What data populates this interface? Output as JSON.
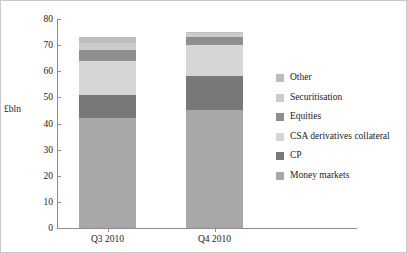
{
  "chart_data": {
    "type": "bar",
    "stacked": true,
    "title": "",
    "subtitle": "",
    "xlabel": "",
    "ylabel": "£bln",
    "ylim": [
      0,
      80
    ],
    "yticks": [
      0,
      10,
      20,
      30,
      40,
      50,
      60,
      70,
      80
    ],
    "ytick_labels": [
      "0",
      "10",
      "20",
      "30",
      "40",
      "50",
      "60",
      "70",
      "80"
    ],
    "grid": false,
    "legend_position": "right",
    "categories": [
      "Q3 2010",
      "Q4 2010"
    ],
    "series": [
      {
        "name": "Money markets",
        "values": [
          42,
          45
        ],
        "color": "#a8a8a8"
      },
      {
        "name": "CP",
        "values": [
          9,
          13
        ],
        "color": "#787878"
      },
      {
        "name": "CSA derivatives collateral",
        "values": [
          13,
          12
        ],
        "color": "#d6d6d6"
      },
      {
        "name": "Equities",
        "values": [
          4,
          3
        ],
        "color": "#8f8f8f"
      },
      {
        "name": "Securitisation",
        "values": [
          3,
          1.5
        ],
        "color": "#cccccc"
      },
      {
        "name": "Other",
        "values": [
          2,
          0.5
        ],
        "color": "#bdbdbd"
      }
    ],
    "totals": [
      73,
      75
    ],
    "legend_order_displayed": [
      "Other",
      "Securitisation",
      "Equities",
      "CSA derivatives collateral",
      "CP",
      "Money markets"
    ]
  },
  "axis": {
    "y_title": "£bln"
  },
  "legend": {
    "items": [
      {
        "label": "Other",
        "color": "#bdbdbd"
      },
      {
        "label": "Securitisation",
        "color": "#cccccc"
      },
      {
        "label": "Equities",
        "color": "#8f8f8f"
      },
      {
        "label": "CSA derivatives collateral",
        "color": "#d6d6d6"
      },
      {
        "label": "CP",
        "color": "#787878"
      },
      {
        "label": "Money markets",
        "color": "#a8a8a8"
      }
    ]
  }
}
